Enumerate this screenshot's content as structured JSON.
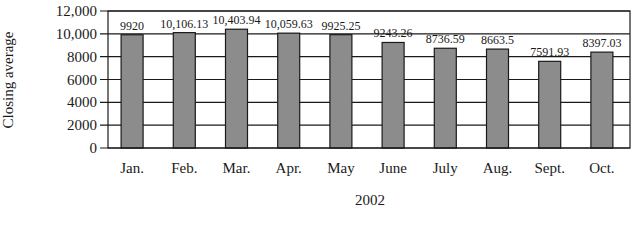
{
  "chart_data": {
    "type": "bar",
    "title": "",
    "xlabel": "2002",
    "ylabel": "Closing average",
    "categories": [
      "Jan.",
      "Feb.",
      "Mar.",
      "Apr.",
      "May",
      "June",
      "July",
      "Aug.",
      "Sept.",
      "Oct."
    ],
    "values": [
      9920,
      10106.13,
      10403.94,
      10059.63,
      9925.25,
      9243.26,
      8736.59,
      8663.5,
      7591.93,
      8397.03
    ],
    "data_labels": [
      "9920",
      "10,106.13",
      "10,403.94",
      "10,059.63",
      "9925.25",
      "9243.26",
      "8736.59",
      "8663.5",
      "7591.93",
      "8397.03"
    ],
    "ylim": [
      0,
      12000
    ],
    "yticks": [
      0,
      2000,
      4000,
      6000,
      8000,
      10000,
      12000
    ],
    "ytick_labels": [
      "0",
      "2000",
      "4000",
      "6000",
      "8000",
      "10,000",
      "12,000"
    ],
    "grid": true,
    "legend": null,
    "colors": {
      "bar": "#8c8c8c",
      "bar_edge": "#1a1a1a",
      "grid": "#1a1a1a",
      "background": "#ffffff"
    }
  }
}
